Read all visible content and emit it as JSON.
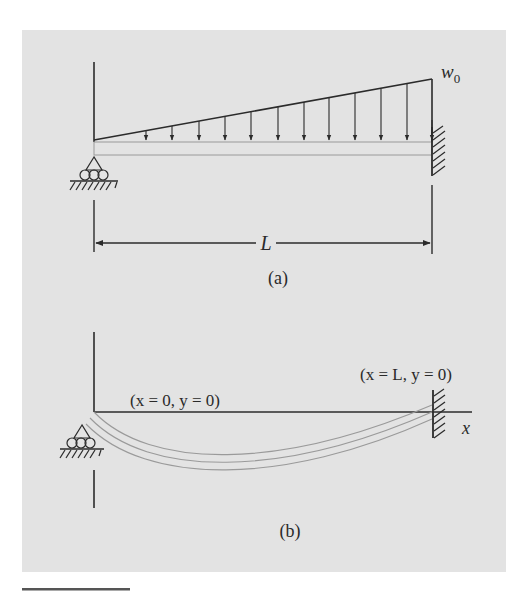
{
  "figure": {
    "background": "#e3e3e3",
    "line_color": "#2b2b2b",
    "beam_color": "#9a9a9a",
    "panel_a": {
      "caption": "(a)",
      "load_label_base": "w",
      "load_label_sub": "0",
      "span_label": "L",
      "load_type": "linearly increasing distributed load",
      "left_support": "roller",
      "right_support": "fixed wall"
    },
    "panel_b": {
      "caption": "(b)",
      "left_bc": "(x = 0, y = 0)",
      "right_bc": "(x = L, y = 0)",
      "axis_label": "x",
      "description": "deflected beam shape"
    }
  }
}
